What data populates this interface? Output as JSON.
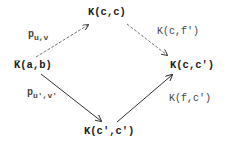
{
  "diagram": {
    "nodes": {
      "left": "K̅(a,b)",
      "top": "K(c,c)",
      "right": "K(c,c′)",
      "bottom": "K(c′,c′)"
    },
    "edges": {
      "left_to_top": {
        "main": "p",
        "sub": "u,v"
      },
      "left_to_bottom": {
        "main": "p",
        "sub": "u′,v′"
      },
      "top_to_right": "K(c,f′)",
      "bottom_to_right": "K(f,c′)"
    },
    "colors": {
      "text": "#222222",
      "arrow_dashed": "#666666",
      "arrow_solid": "#333333"
    }
  }
}
